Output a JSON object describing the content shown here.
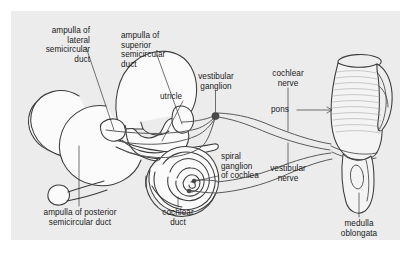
{
  "figure": {
    "panel_background": "#ececec",
    "page_background": "#ffffff",
    "line_color": "#3b3b3b",
    "text_color": "#1a1a1a"
  },
  "labels": {
    "ampulla_lateral": "ampulla of\nlateral\nsemicircular\nduct",
    "ampulla_superior": "ampulla of\nsuperior\nsemicircular\nduct",
    "utricle": "utricle",
    "vestibular_ganglion": "vestibular\nganglion",
    "cochlear_nerve": "cochlear\nnerve",
    "pons": "pons",
    "vestibular_nerve": "vestibular\nnerve",
    "spiral_ganglion": "spiral\nganglion\nof cochlea",
    "ampulla_posterior": "ampulla of posterior\nsemicircular duct",
    "cochlear_duct": "cochlear\nduct",
    "medulla_oblongata": "medulla\noblongata"
  }
}
